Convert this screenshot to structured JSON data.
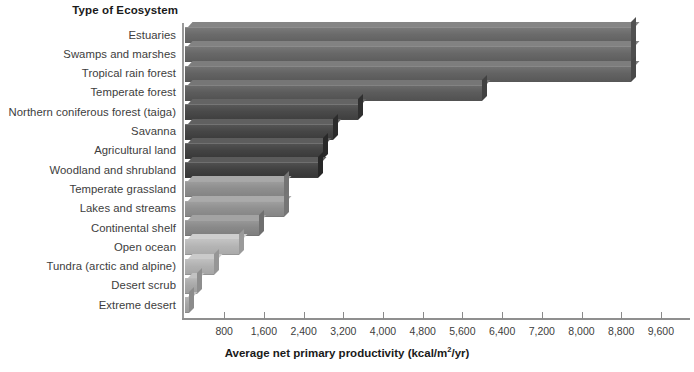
{
  "chart_data": {
    "type": "bar",
    "orientation": "horizontal",
    "title": "",
    "category_axis_title": "Type of Ecosystem",
    "xlabel": "Average net primary productivity (kcal/m2/yr)",
    "xlabel_prefix": "Average net primary productivity (kcal/m",
    "xlabel_sup": "2",
    "xlabel_suffix": "/yr)",
    "ylabel": "",
    "xlim": [
      0,
      9600
    ],
    "grid": false,
    "legend": "none",
    "tick_labels": [
      "800",
      "1,600",
      "2,400",
      "3,200",
      "4,000",
      "4,800",
      "5,600",
      "6,400",
      "7,200",
      "8,000",
      "8,800",
      "9,600"
    ],
    "tick_values": [
      800,
      1600,
      2400,
      3200,
      4000,
      4800,
      5600,
      6400,
      7200,
      8000,
      8800,
      9600
    ],
    "categories": [
      "Estuaries",
      "Swamps and marshes",
      "Tropical rain forest",
      "Temperate forest",
      "Northern coniferous forest (taiga)",
      "Savanna",
      "Agricultural land",
      "Woodland and shrubland",
      "Temperate grassland",
      "Lakes and streams",
      "Continental shelf",
      "Open ocean",
      "Tundra (arctic and alpine)",
      "Desert scrub",
      "Extreme desert"
    ],
    "values": [
      9000,
      9000,
      9000,
      6000,
      3500,
      3000,
      2800,
      2700,
      2000,
      2000,
      1500,
      1100,
      600,
      250,
      100
    ],
    "bar_colors": [
      "#6b6b6b",
      "#686868",
      "#636363",
      "#5c5c5c",
      "#4a4a4a",
      "#464646",
      "#434343",
      "#414141",
      "#8e8e8e",
      "#909090",
      "#898989",
      "#b4b4b4",
      "#b0b0b0",
      "#a8a8a8",
      "#a5a5a5"
    ],
    "accent_color": "#4a4a4a",
    "background_color": "#ffffff",
    "text_color": "#3d3d3d"
  }
}
